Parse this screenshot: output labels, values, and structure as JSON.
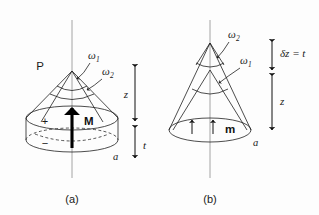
{
  "figure": {
    "type": "scientific-diagram",
    "background_color": "#fdfdfd",
    "ink_color": "#1f1f1f",
    "axis_color": "#9a9a9a",
    "panels": [
      {
        "id": "a",
        "caption": "(a)",
        "apex_label": "P",
        "solid_angle_outer_label": "ω",
        "solid_angle_outer_sub": "1",
        "solid_angle_inner_label": "ω",
        "solid_angle_inner_sub": "2",
        "body_shape": "disc-cylinder-with-cone",
        "top_surface_charge": "+",
        "bottom_surface_charge": "−",
        "vector_label": "M",
        "vector_direction": "up",
        "radius_label": "a",
        "dimension_long_label": "z",
        "dimension_short_label": "t"
      },
      {
        "id": "b",
        "caption": "(b)",
        "solid_angle_upper_label": "ω",
        "solid_angle_upper_sub": "2",
        "solid_angle_lower_label": "ω",
        "solid_angle_lower_sub": "1",
        "body_shape": "two-nested-cones-on-disc",
        "vector_label": "m",
        "vector_direction": "up",
        "radius_label": "a",
        "dimension_short_label": "δz = t",
        "dimension_long_label": "z"
      }
    ]
  },
  "panel_a": {
    "apex": "P",
    "omega1": "ω",
    "omega1_sub": "1",
    "omega2": "ω",
    "omega2_sub": "2",
    "plus": "+",
    "minus": "−",
    "moment": "M",
    "radius": "a",
    "dim_z": "z",
    "dim_t": "t",
    "caption": "(a)"
  },
  "panel_b": {
    "omega2": "ω",
    "omega2_sub": "2",
    "omega1": "ω",
    "omega1_sub": "1",
    "moment": "m",
    "radius": "a",
    "dim_dz": "δz = t",
    "dim_z": "z",
    "caption": "(b)"
  }
}
